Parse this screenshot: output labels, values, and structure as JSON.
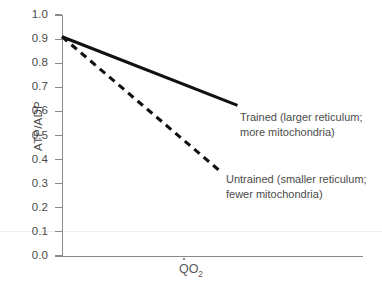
{
  "chart_data": {
    "type": "line",
    "title": "",
    "subtitle": "",
    "xlabel": "QO2",
    "xlabel_parts": {
      "symbol": "Q",
      "overdot": true,
      "subscript": "O",
      "subscript2": "2"
    },
    "ylabel": "ATP/ADP",
    "xlim": [
      0,
      1
    ],
    "ylim": [
      0.0,
      1.0
    ],
    "grid": false,
    "legend_position": "inline-annotation",
    "x_ticks": [],
    "x_tick_labels": [],
    "y_ticks": [
      0.0,
      0.1,
      0.2,
      0.3,
      0.4,
      0.5,
      0.6,
      0.7,
      0.8,
      0.9,
      1.0
    ],
    "y_tick_labels": [
      "0.0",
      "0.1",
      "0.2",
      "0.3",
      "0.4",
      "0.5",
      "0.6",
      "0.7",
      "0.8",
      "0.9",
      "1.0"
    ],
    "series": [
      {
        "name": "Trained",
        "style": "solid",
        "color": "#111111",
        "x": [
          0.0,
          0.583
        ],
        "y": [
          0.91,
          0.625
        ],
        "label_line1": "Trained (larger reticulum;",
        "label_line2": "more mitochondria)"
      },
      {
        "name": "Untrained",
        "style": "dashed",
        "color": "#111111",
        "x": [
          0.0,
          0.532
        ],
        "y": [
          0.91,
          0.345
        ],
        "label_line1": "Untrained (smaller reticulum;",
        "label_line2": "fewer mitochondria)"
      }
    ],
    "annotations": [
      {
        "id": "trained",
        "line1": "Trained (larger reticulum;",
        "line2": "more mitochondria)"
      },
      {
        "id": "untrained",
        "line1": "Untrained (smaller reticulum;",
        "line2": "fewer mitochondria)"
      }
    ],
    "colors": {
      "axis": "#8a8a8a",
      "tick_label": "#4a4a4a",
      "annotation": "#4b4b4b",
      "line": "#111111"
    }
  }
}
